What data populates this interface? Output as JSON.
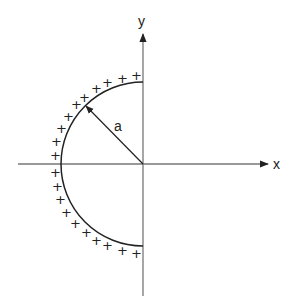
{
  "diagram": {
    "axes": {
      "x_label": "x",
      "y_label": "y"
    },
    "radius_label": "a",
    "charge_symbol": "+",
    "charge_count": 20,
    "shape": "semicircular arc (left half), radius a, centered at origin",
    "colors": {
      "stroke": "#222222",
      "axis": "#777777",
      "background": "#ffffff"
    }
  }
}
